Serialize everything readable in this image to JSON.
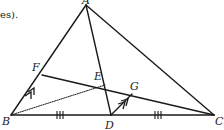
{
  "caption": {
    "text": "es)."
  },
  "figure": {
    "type": "triangle-geometry",
    "colors": {
      "stroke": "#1a1a1a",
      "background": "#ffffff"
    },
    "points": {
      "A": {
        "label": "A",
        "x": 86,
        "y": 5
      },
      "B": {
        "label": "B",
        "x": 11,
        "y": 115
      },
      "C": {
        "label": "C",
        "x": 214,
        "y": 115
      },
      "D": {
        "label": "D",
        "x": 111,
        "y": 115
      },
      "E": {
        "label": "E",
        "x": 105,
        "y": 85
      },
      "F": {
        "label": "F",
        "x": 42,
        "y": 75
      },
      "G": {
        "label": "G",
        "x": 132,
        "y": 94
      }
    },
    "segments": [
      {
        "from": "A",
        "to": "B",
        "style": "solid"
      },
      {
        "from": "A",
        "to": "C",
        "style": "solid"
      },
      {
        "from": "B",
        "to": "C",
        "style": "solid"
      },
      {
        "from": "A",
        "to": "D",
        "style": "solid"
      },
      {
        "from": "F",
        "to": "C",
        "style": "solid"
      },
      {
        "from": "D",
        "to": "G",
        "style": "solid"
      },
      {
        "from": "B",
        "to": "E",
        "style": "dotted"
      }
    ],
    "markings": [
      {
        "type": "triple-tick",
        "segment": "BD"
      },
      {
        "type": "triple-tick",
        "segment": "DC"
      },
      {
        "type": "double-arrow-parallel",
        "segment": "BF"
      },
      {
        "type": "double-arrow-parallel",
        "segment": "DG"
      }
    ]
  }
}
